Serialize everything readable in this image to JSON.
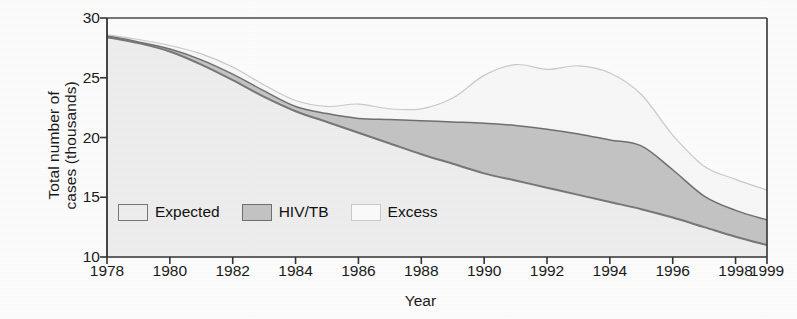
{
  "chart_data": {
    "type": "area",
    "stacked": true,
    "title": "",
    "xlabel": "Year",
    "ylabel": "Total number of cases (thousands)",
    "ylabel_line1": "Total number of",
    "ylabel_line2": "cases (thousands)",
    "xlim": [
      1978,
      1999
    ],
    "ylim": [
      10,
      30
    ],
    "yticks": [
      10,
      15,
      20,
      25,
      30
    ],
    "xticks": [
      1978,
      1980,
      1982,
      1984,
      1986,
      1988,
      1990,
      1992,
      1994,
      1996,
      1998,
      1999
    ],
    "grid": false,
    "legend_position": "inside-bottom-left",
    "legend": [
      "Expected",
      "HIV/TB",
      "Excess"
    ],
    "colors": {
      "expected_fill": "#ededed",
      "expected_line": "#777777",
      "hivtb_fill": "#c3c3c3",
      "hivtb_line": "#6f6f6f",
      "excess_fill": "#f7f7f7",
      "excess_line": "#c9c9c9",
      "axis": "#3a3a3a",
      "text": "#111111"
    },
    "x": [
      1978,
      1979,
      1980,
      1981,
      1982,
      1983,
      1984,
      1985,
      1986,
      1987,
      1988,
      1989,
      1990,
      1991,
      1992,
      1993,
      1994,
      1995,
      1996,
      1997,
      1998,
      1999
    ],
    "series": [
      {
        "name": "Expected",
        "note": "lowest band, baseline-to-curve",
        "values": [
          28.4,
          27.9,
          27.2,
          26.1,
          24.8,
          23.4,
          22.2,
          21.3,
          20.4,
          19.5,
          18.6,
          17.8,
          17.0,
          16.4,
          15.8,
          15.2,
          14.6,
          14.0,
          13.3,
          12.5,
          11.7,
          11.0
        ]
      },
      {
        "name": "HIV/TB",
        "note": "cumulative top of Expected+HIV/TB band",
        "values": [
          28.5,
          28.0,
          27.4,
          26.5,
          25.3,
          23.9,
          22.6,
          22.0,
          21.6,
          21.5,
          21.4,
          21.3,
          21.2,
          21.0,
          20.7,
          20.3,
          19.8,
          19.3,
          17.3,
          15.1,
          13.9,
          13.1
        ]
      },
      {
        "name": "Excess",
        "note": "cumulative total, top of all three bands",
        "values": [
          28.6,
          28.2,
          27.7,
          27.0,
          25.9,
          24.4,
          23.1,
          22.6,
          22.8,
          22.4,
          22.4,
          23.3,
          25.2,
          26.1,
          25.7,
          26.0,
          25.4,
          23.6,
          20.2,
          17.6,
          16.5,
          15.6
        ]
      }
    ]
  }
}
